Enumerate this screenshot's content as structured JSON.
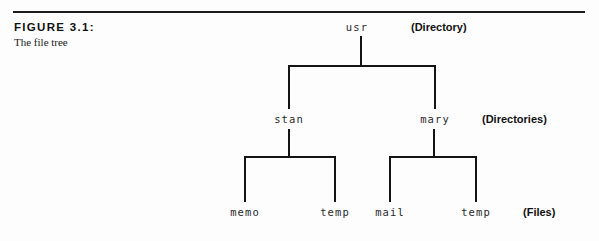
{
  "figure": {
    "label": "FIGURE 3.1:",
    "caption": "The file tree"
  },
  "annotations": {
    "level0": "(Directory)",
    "level1": "(Directories)",
    "level2": "(Files)"
  },
  "tree": {
    "root": {
      "name": "usr"
    },
    "directories": [
      {
        "name": "stan"
      },
      {
        "name": "mary"
      }
    ],
    "files": [
      {
        "name": "memo"
      },
      {
        "name": "temp"
      },
      {
        "name": "mail"
      },
      {
        "name": "temp"
      }
    ]
  },
  "colors": {
    "rule": "#1b1b1b",
    "stroke": "#141414",
    "text": "#111111",
    "mono_text": "#2a2a2a",
    "background": "#fdfdfd"
  }
}
